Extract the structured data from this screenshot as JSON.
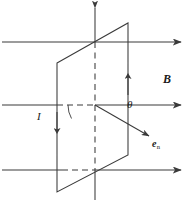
{
  "figure": {
    "kind": "physics-vector-diagram",
    "background_color": "#ffffff",
    "stroke_color": "#3a3a3a",
    "label_color": "#1a1a1a"
  },
  "labels": {
    "field": "B",
    "angle": "θ",
    "current": "I",
    "normal_base": "e",
    "normal_sub": "n"
  },
  "geometry": {
    "field_lines": [
      {
        "name": "field-line-top",
        "y": 42,
        "x1": 2,
        "x2": 184
      },
      {
        "name": "field-line-middle",
        "y": 105,
        "x1": 2,
        "x2": 184
      },
      {
        "name": "field-line-bottom",
        "y": 170,
        "x1": 2,
        "x2": 184
      }
    ],
    "vertical_axis": {
      "x": 95,
      "y_top": 5,
      "y_bottom": 200
    },
    "loop_points": "57,63 128,23 128,155 57,192",
    "normal_vector": {
      "x1": 95,
      "y1": 105,
      "x2": 152,
      "y2": 138
    },
    "angle_arc_degrees": 30
  }
}
